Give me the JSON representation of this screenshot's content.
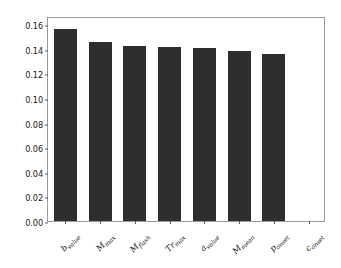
{
  "chart_data": {
    "type": "bar",
    "title": "",
    "xlabel": "",
    "ylabel": "",
    "ylim": [
      0.0,
      0.1665
    ],
    "grid": false,
    "legend": null,
    "bar_color": "#2e2e2e",
    "categories": [
      "b_value",
      "M_max",
      "M_flash",
      "Tr_max",
      "a_value",
      "M_mean",
      "p_onset",
      "c_onset"
    ],
    "category_parts": [
      {
        "base": "b",
        "sub": "value"
      },
      {
        "base": "M",
        "sub": "max"
      },
      {
        "base": "M",
        "sub": "flash"
      },
      {
        "base": "Tr",
        "sub": "max"
      },
      {
        "base": "a",
        "sub": "value"
      },
      {
        "base": "M",
        "sub": "mean"
      },
      {
        "base": "p",
        "sub": "onset"
      },
      {
        "base": "c",
        "sub": "onset"
      }
    ],
    "values": [
      0.156,
      0.145,
      0.142,
      0.141,
      0.1405,
      0.138,
      0.136,
      0.0
    ],
    "ytick_labels": [
      "0.00",
      "0.02",
      "0.04",
      "0.06",
      "0.08",
      "0.10",
      "0.12",
      "0.14",
      "0.16"
    ],
    "ytick_values": [
      0.0,
      0.02,
      0.04,
      0.06,
      0.08,
      0.1,
      0.12,
      0.14,
      0.16
    ]
  }
}
